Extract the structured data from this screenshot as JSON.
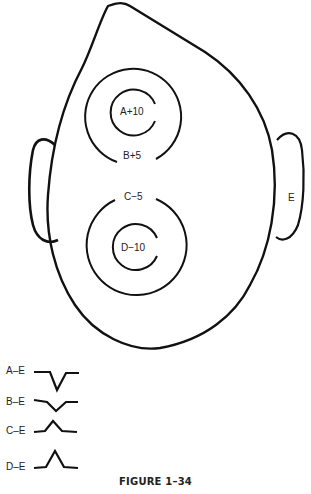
{
  "figure": {
    "caption": "FIGURE 1–34",
    "electrode_labels": {
      "A": "A+10",
      "B": "B+5",
      "C": "C−5",
      "D": "D−10",
      "E": "E"
    },
    "waveforms": [
      {
        "label": "A–E",
        "shape": "deep-negative-dip"
      },
      {
        "label": "B–E",
        "shape": "shallow-negative-dip"
      },
      {
        "label": "C–E",
        "shape": "shallow-positive-peak"
      },
      {
        "label": "D–E",
        "shape": "tall-positive-peak"
      }
    ],
    "stroke_color": "#111111"
  }
}
